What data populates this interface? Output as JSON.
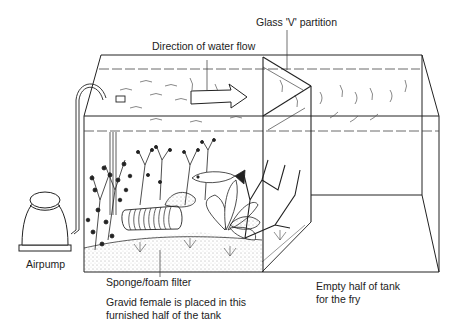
{
  "diagram": {
    "labels": {
      "partition": "Glass 'V' partition",
      "water_flow": "Direction of water flow",
      "airpump": "Airpump",
      "filter": "Sponge/foam filter",
      "female_line1": "Gravid female is placed in this",
      "female_line2": "furnished half of the tank",
      "fry_line1": "Empty half of tank",
      "fry_line2": "for the fry"
    },
    "components": [
      "airpump",
      "air-tube",
      "sponge-foam-filter",
      "plants",
      "fish",
      "driftwood",
      "gravel",
      "glass-v-partition",
      "flow-arrow"
    ],
    "colors": {
      "ink": "#1a1a1a",
      "background": "#ffffff"
    }
  }
}
